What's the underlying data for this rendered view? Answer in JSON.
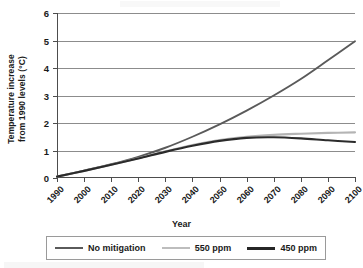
{
  "chart_data": {
    "type": "line",
    "title": "",
    "xlabel": "Year",
    "ylabel": "Temperature increase from 1990 levels (°C)",
    "ylabel_lines": [
      "Temperature increase",
      "from 1990 levels (°C)"
    ],
    "x": [
      1990,
      2000,
      2010,
      2020,
      2030,
      2040,
      2050,
      2060,
      2070,
      2080,
      2090,
      2100
    ],
    "xtick_labels": [
      "1990",
      "2000",
      "2010",
      "2020",
      "2030",
      "2040",
      "2050",
      "2060",
      "2070",
      "2080",
      "2090",
      "2100"
    ],
    "ytick_labels": [
      "0",
      "1",
      "2",
      "3",
      "4",
      "5",
      "6"
    ],
    "ytick_values": [
      0,
      1,
      2,
      3,
      4,
      5,
      6
    ],
    "xlim": [
      1990,
      2100
    ],
    "ylim": [
      0,
      6
    ],
    "grid": "horizontal",
    "legend_position": "bottom",
    "series": [
      {
        "name": "No mitigation",
        "color": "#5a5a5a",
        "width": 1.9,
        "values": [
          0.05,
          0.27,
          0.5,
          0.77,
          1.1,
          1.5,
          1.95,
          2.45,
          3.0,
          3.6,
          4.28,
          4.97
        ]
      },
      {
        "name": "550 ppm",
        "color": "#b4b4b4",
        "width": 2.1,
        "values": [
          0.05,
          0.26,
          0.48,
          0.72,
          0.97,
          1.2,
          1.38,
          1.5,
          1.57,
          1.61,
          1.64,
          1.66
        ]
      },
      {
        "name": "450 ppm",
        "color": "#2b2b2b",
        "width": 2.1,
        "values": [
          0.05,
          0.26,
          0.48,
          0.71,
          0.95,
          1.17,
          1.35,
          1.46,
          1.48,
          1.44,
          1.37,
          1.31
        ]
      }
    ]
  },
  "legend": {
    "items": [
      {
        "label": "No mitigation",
        "color": "#5a5a5a",
        "thickness": "2px"
      },
      {
        "label": "550 ppm",
        "color": "#bdbdbd",
        "thickness": "2px"
      },
      {
        "label": "450 ppm",
        "color": "#262626",
        "thickness": "3px"
      }
    ]
  }
}
